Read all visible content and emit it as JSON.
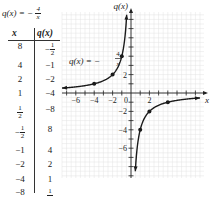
{
  "table": {
    "title_prefix": "q(x) = −",
    "title_num": "4",
    "title_den": "x",
    "col_x": "x",
    "col_q": "q(x)",
    "rows": [
      {
        "x": "8",
        "q": "-1/2"
      },
      {
        "x": "4",
        "q": "−1"
      },
      {
        "x": "2",
        "q": "−2"
      },
      {
        "x": "1",
        "q": "−4"
      },
      {
        "x": "1/2",
        "q": "−8"
      },
      {
        "x": "-1/2",
        "q": "8"
      },
      {
        "x": "−1",
        "q": "4"
      },
      {
        "x": "−2",
        "q": "2"
      },
      {
        "x": "−4",
        "q": "1"
      },
      {
        "x": "−8",
        "q": "1/2"
      }
    ]
  },
  "chart_data": {
    "type": "line",
    "title": "",
    "function": "q(x) = -4/x",
    "annotation": {
      "prefix": "q(x) = −",
      "num": "4",
      "den": "x"
    },
    "xlabel": "x",
    "ylabel": "q(x)",
    "xlim": [
      -7.5,
      7.5
    ],
    "ylim": [
      -9,
      9
    ],
    "grid": true,
    "x_ticks": [
      -6,
      -4,
      -2,
      2
    ],
    "x_tick_labels": [
      "−6",
      "−4",
      "−2",
      "2"
    ],
    "origin_label": "0",
    "y_ticks": [
      2,
      -2,
      -4,
      -6
    ],
    "y_tick_labels": [
      "2",
      "−2",
      "−4",
      "−6"
    ],
    "series": [
      {
        "name": "left branch",
        "x_range": [
          -7.5,
          -0.47
        ],
        "points": [
          [
            -4,
            1
          ],
          [
            -2,
            2
          ],
          [
            -1,
            4
          ]
        ]
      },
      {
        "name": "right branch",
        "x_range": [
          0.47,
          7.5
        ],
        "points": [
          [
            1,
            -4
          ],
          [
            2,
            -2
          ],
          [
            4,
            -1
          ]
        ]
      }
    ]
  }
}
